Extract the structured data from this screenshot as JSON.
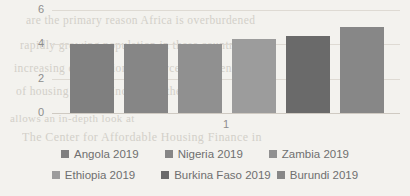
{
  "chart_data": {
    "type": "bar",
    "title": "",
    "xlabel": "",
    "ylabel": "",
    "categories": [
      "1"
    ],
    "xtick_labels": [
      "1"
    ],
    "yticks": [
      0,
      2,
      4,
      6
    ],
    "ylim": [
      0,
      6
    ],
    "grid": true,
    "legend_position": "bottom",
    "series": [
      {
        "name": "Angola 2019",
        "values": [
          4.0
        ],
        "color": "#7f7f7f"
      },
      {
        "name": "Nigeria 2019",
        "values": [
          4.0
        ],
        "color": "#868686"
      },
      {
        "name": "Zambia 2019",
        "values": [
          4.0
        ],
        "color": "#909090"
      },
      {
        "name": "Ethiopia 2019",
        "values": [
          4.3
        ],
        "color": "#9c9c9c"
      },
      {
        "name": "Burkina Faso 2019",
        "values": [
          4.5
        ],
        "color": "#6a6a6a"
      },
      {
        "name": "Burundi 2019",
        "values": [
          5.0
        ],
        "color": "#878787"
      }
    ]
  },
  "legend": {
    "rows": [
      [
        {
          "label": "Angola 2019",
          "color": "#7f7f7f"
        },
        {
          "label": "Nigeria 2019",
          "color": "#868686"
        },
        {
          "label": "Zambia 2019",
          "color": "#909090"
        }
      ],
      [
        {
          "label": "Ethiopia 2019",
          "color": "#9c9c9c"
        },
        {
          "label": "Burkina Faso 2019",
          "color": "#6a6a6a"
        },
        {
          "label": "Burundi 2019",
          "color": "#878787"
        }
      ]
    ]
  },
  "background_ghost_text": {
    "lines": [
      "are the primary reason Africa is overburdened",
      "rapidly growing population in these countries",
      "increasing competition for scarce permanent",
      "of housing supply. Increasing the size of",
      "The Center for Affordable Housing Finance in",
      "allows an in-depth look at"
    ]
  }
}
